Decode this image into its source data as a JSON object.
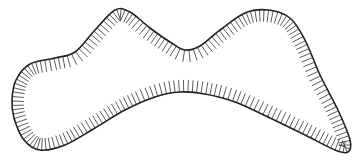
{
  "diagram": {
    "type": "closed-contour-with-inner-hatching",
    "stroke_color": "#222222",
    "hatch_color": "#333333",
    "background": "#ffffff",
    "outline_points": [
      [
        14,
        118
      ],
      [
        12,
        100
      ],
      [
        16,
        80
      ],
      [
        30,
        64
      ],
      [
        55,
        58
      ],
      [
        75,
        52
      ],
      [
        95,
        30
      ],
      [
        115,
        10
      ],
      [
        130,
        12
      ],
      [
        150,
        28
      ],
      [
        170,
        42
      ],
      [
        185,
        50
      ],
      [
        200,
        46
      ],
      [
        220,
        30
      ],
      [
        245,
        13
      ],
      [
        268,
        10
      ],
      [
        290,
        18
      ],
      [
        305,
        40
      ],
      [
        320,
        75
      ],
      [
        338,
        110
      ],
      [
        350,
        140
      ],
      [
        348,
        152
      ],
      [
        335,
        150
      ],
      [
        305,
        135
      ],
      [
        270,
        118
      ],
      [
        235,
        102
      ],
      [
        205,
        94
      ],
      [
        180,
        92
      ],
      [
        155,
        97
      ],
      [
        125,
        110
      ],
      [
        95,
        128
      ],
      [
        65,
        145
      ],
      [
        40,
        150
      ],
      [
        24,
        140
      ]
    ],
    "hatch_length": 12,
    "hatch_spacing": 4.2
  }
}
